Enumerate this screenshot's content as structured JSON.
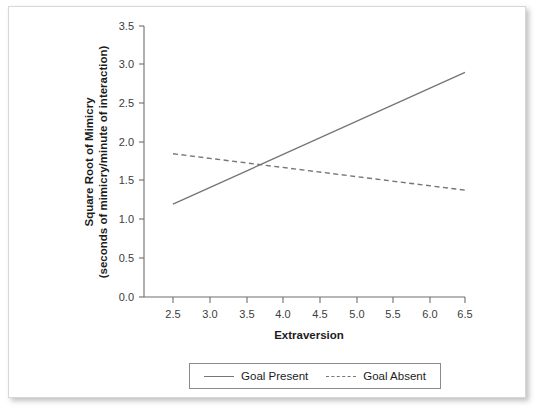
{
  "figure": {
    "background_color": "#ffffff",
    "frame_color": "#d7d7d7",
    "line_color": "#767676",
    "axis_color": "#6e6e6e"
  },
  "chart_data": {
    "type": "line",
    "title": "",
    "xlabel": "Extraversion",
    "ylabel_line1": "Square Root of Mimicry",
    "ylabel_line2": "(seconds of mimicry/minute of interaction)",
    "ylabel": "Square Root of Mimicry (seconds of mimicry/minute of interaction)",
    "xlim": [
      2.3,
      6.7
    ],
    "ylim": [
      0.0,
      3.5
    ],
    "xticks": [
      2.5,
      3.0,
      3.5,
      4.0,
      4.5,
      5.0,
      5.5,
      6.0,
      6.5
    ],
    "xtick_labels": [
      "2.5",
      "3.0",
      "3.5",
      "4.0",
      "4.5",
      "5.0",
      "5.5",
      "6.0",
      "6.5"
    ],
    "yticks": [
      0.0,
      0.5,
      1.0,
      1.5,
      2.0,
      2.5,
      3.0,
      3.5
    ],
    "ytick_labels": [
      "0.0",
      "0.5",
      "1.0",
      "1.5",
      "2.0",
      "2.5",
      "3.0",
      "3.5"
    ],
    "grid": false,
    "legend_position": "below-axis-center",
    "x": [
      2.5,
      6.5
    ],
    "series": [
      {
        "name": "Goal Present",
        "style": "solid",
        "values": [
          1.2,
          2.9
        ]
      },
      {
        "name": "Goal Absent",
        "style": "dashed",
        "values": [
          1.85,
          1.38
        ]
      }
    ]
  },
  "legend": {
    "entries": [
      {
        "label": "Goal Present",
        "style": "solid"
      },
      {
        "label": "Goal Absent",
        "style": "dashed"
      }
    ]
  }
}
